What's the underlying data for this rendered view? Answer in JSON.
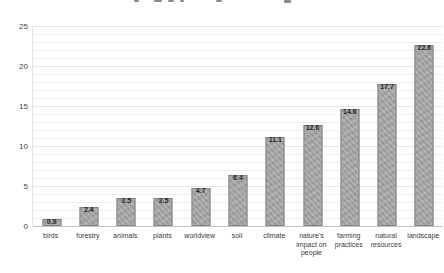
{
  "chart_data": {
    "type": "bar",
    "title": "",
    "title_note": "title cropped off at top edge of screenshot",
    "categories": [
      "birds",
      "forestry",
      "animals",
      "plants",
      "worldview",
      "soil",
      "climate",
      "nature's impact on people",
      "farming practices",
      "natural resources",
      "landscape"
    ],
    "values": [
      0.9,
      2.4,
      3.5,
      3.5,
      4.7,
      6.4,
      11.1,
      12.6,
      14.6,
      17.7,
      22.6
    ],
    "value_labels": [
      "0.9",
      "2.4",
      "3.5",
      "3.5",
      "4.7",
      "6.4",
      "11.1",
      "12.6",
      "14.6",
      "17.7",
      "22.6"
    ],
    "xlabel": "",
    "ylabel": "",
    "y_ticks": [
      0,
      5,
      10,
      15,
      20,
      25
    ],
    "ylim": [
      0,
      25
    ],
    "grid": "horizontal, minor every 1 unit",
    "legend": "none",
    "colors": {
      "bar_fill": "#a7a7a7",
      "bar_border": "#858585",
      "gridline": "#eeeeee",
      "axis_line": "#c2c2c2",
      "tick_text": "#3f3f3f",
      "value_text": "#262626",
      "background": "#ffffff"
    }
  }
}
